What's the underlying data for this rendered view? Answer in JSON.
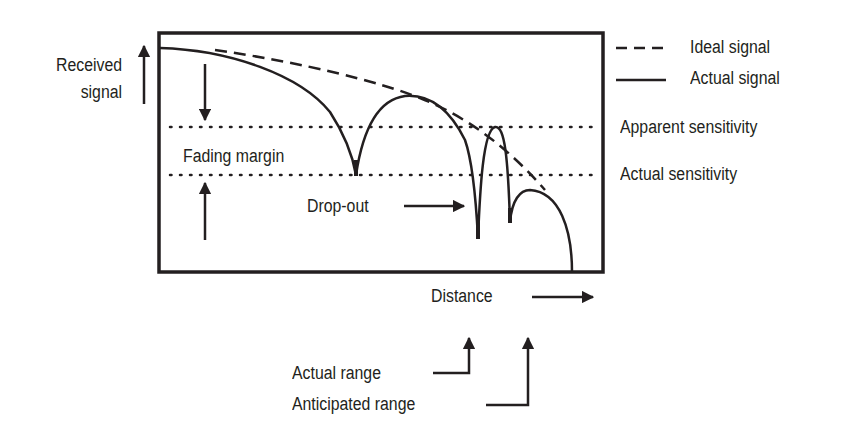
{
  "diagram": {
    "y_axis_label_line1": "Received",
    "y_axis_label_line2": "signal",
    "x_axis_label": "Distance",
    "legend": [
      {
        "style": "dashed",
        "label": "Ideal signal"
      },
      {
        "style": "solid",
        "label": "Actual signal"
      }
    ],
    "threshold_labels": {
      "apparent": "Apparent sensitivity",
      "actual": "Actual sensitivity"
    },
    "annotations": {
      "fading_margin": "Fading margin",
      "drop_out": "Drop-out",
      "actual_range": "Actual range",
      "anticipated_range": "Anticipated range"
    },
    "colors": {
      "ink": "#231f20",
      "background": "#ffffff"
    }
  }
}
